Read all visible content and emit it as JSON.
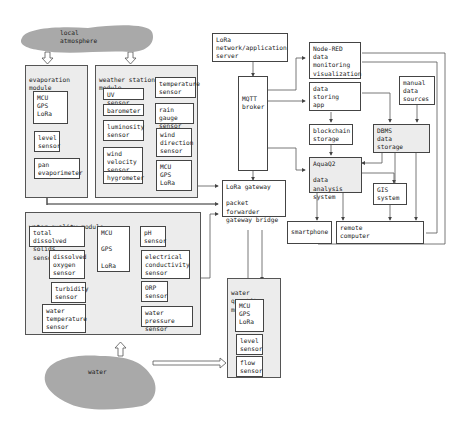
{
  "local_atmosphere": {
    "label": "local\natmosphere"
  },
  "water": {
    "label": "water"
  },
  "evaporation_module": {
    "title": "evaporation\nmodule",
    "mcu": "MCU\n  GPS\n  LoRa",
    "level_sensor": "level\nsensor",
    "pan_evaporimeter": "pan\nevaporimeter"
  },
  "weather_station_module": {
    "title": "weather station\nmodule",
    "uv_sensor": "UV sensor",
    "barometer": "barometer",
    "luminosity_sensor": "luminosity\nsensor",
    "wind_velocity_sensor": "wind\nvelocity\nsensor",
    "hygrometer": "hygrometer",
    "temperature_sensor": "temperature\nsensor",
    "rain_gauge_sensor": "rain gauge\nsensor",
    "wind_direction_sensor": "wind\ndirection\nsensor",
    "mcu": "MCU\n  GPS\n  LoRa"
  },
  "water_quality_module": {
    "title": "water quality module",
    "tds_sensor": "total dissolved\nsolids sensor",
    "dissolved_oxygen_sensor": "dissolved\noxygen\nsensor",
    "turbidity_sensor": "turbidity\nsensor",
    "water_temperature_sensor": "water\ntemperature\nsensor",
    "mcu": "MCU\n\n   GPS\n\n   LoRa",
    "ph_sensor": "pH\nsensor",
    "ec_sensor": "electrical\nconductivity\nsensor",
    "orp_sensor": "ORP\nsensor",
    "water_pressure_sensor": "water pressure\nsensor"
  },
  "water_quantity_module": {
    "title": "water quantity\nmodule",
    "mcu": "MCU\n  GPS\n  LoRa",
    "level_sensor": "level\nsensor",
    "flow_sensor": "flow\nsensor"
  },
  "lora_server": {
    "label": "LoRa\nnetwork/application\nserver"
  },
  "mqtt_broker": {
    "label": "MQTT\nbroker"
  },
  "lora_gateway": {
    "label": "LoRa gateway\n\npacket forwarder\ngateway bridge"
  },
  "node_red": {
    "label": "Node-RED\ndata\nmonitoring\nvisualization"
  },
  "data_storing_app": {
    "label": "data\nstoring\napp"
  },
  "manual_data_sources": {
    "label": "manual\ndata\nsources"
  },
  "blockchain_storage": {
    "label": "blockchain\nstorage"
  },
  "dbms": {
    "label": "DBMS\ndata\nstorage"
  },
  "aquaq2": {
    "label": "AquaQ2\n\ndata analysis\nsystem"
  },
  "gis": {
    "label": "GIS\nsystem"
  },
  "smartphone": {
    "label": "smartphone"
  },
  "remote_computer": {
    "label": "remote\ncomputer"
  }
}
